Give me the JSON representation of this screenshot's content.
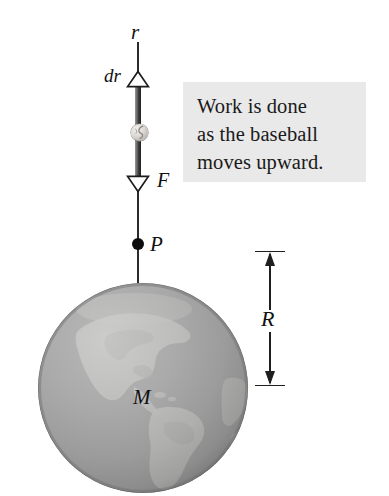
{
  "figure": {
    "background_color": "#ffffff",
    "caption_box_color": "#e9e9e9",
    "line_color": "#2b2b2b",
    "earth_color": "#9d9d9d",
    "ball_color": "#dedbd7"
  },
  "caption": {
    "line1": "Work is done",
    "line2": "as the baseball",
    "line3": "moves upward."
  },
  "labels": {
    "r": "r",
    "dr": "dr",
    "F": "F",
    "P": "P",
    "M": "M",
    "R": "R"
  },
  "objects": {
    "baseball": "baseball",
    "earth": "earth-globe",
    "point_p": "point-P",
    "displacement_arrow": "dr-arrowhead-up",
    "force_arrow": "F-arrowhead-down",
    "radius_dimension": "R-dimension-arrow"
  }
}
